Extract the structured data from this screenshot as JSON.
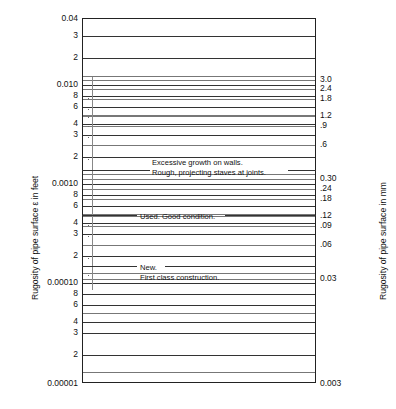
{
  "chart_data": {
    "type": "line",
    "title": "",
    "subtitle": "",
    "orientation": "vertical-log-scale",
    "grid": true,
    "legend_position": "none",
    "left_axis": {
      "label": "Rugosity of pipe surface ε in feet",
      "units": "feet",
      "scale": "log",
      "range": [
        1e-05,
        0.04
      ],
      "tick_labels": [
        "0.04",
        "3",
        "2",
        "0.010",
        "8",
        "6",
        "4",
        "3",
        "2",
        "0.0010",
        "8",
        "6",
        "4",
        "3",
        "2",
        "0.00010",
        "8",
        "6",
        "4",
        "3",
        "2",
        "0.00001"
      ],
      "tick_values": [
        0.04,
        0.03,
        0.02,
        0.01,
        0.008,
        0.006,
        0.004,
        0.003,
        0.002,
        0.001,
        0.0008,
        0.0006,
        0.0004,
        0.0003,
        0.0002,
        0.0001,
        8e-05,
        6e-05,
        4e-05,
        3e-05,
        2e-05,
        1e-05
      ]
    },
    "right_axis": {
      "label": "Rugosity of pipe surface in mm",
      "units": "mm",
      "scale": "log",
      "range": [
        0.003,
        12
      ],
      "tick_labels": [
        "3.0",
        "2.4",
        "1.8",
        "1.2",
        ".9",
        ".6",
        "0.30",
        ".24",
        ".18",
        ".12",
        ".09",
        ".06",
        "0.03",
        "0.003"
      ],
      "tick_values": [
        3.0,
        2.4,
        1.8,
        1.2,
        0.9,
        0.6,
        0.3,
        0.24,
        0.18,
        0.12,
        0.09,
        0.06,
        0.03,
        0.003
      ]
    },
    "annotations": [
      {
        "id": "excessive-growth",
        "line1": "Excessive growth on walls.",
        "line2": "Rough, projecting staves at joints."
      },
      {
        "id": "used-good",
        "line1": "Used. Good condition.",
        "line2": ""
      },
      {
        "id": "new-first-class",
        "line1": "New.",
        "line2": "First class construction."
      }
    ]
  },
  "left_ticks": [
    {
      "label": "0.04",
      "y": 18.0,
      "major": true
    },
    {
      "label": "3",
      "y": 35.0,
      "major": true
    },
    {
      "label": "2",
      "y": 57.0,
      "major": true
    },
    {
      "label": "",
      "y": 75.0,
      "major": false
    },
    {
      "label": "0.010",
      "y": 84.0,
      "major": true
    },
    {
      "label": "8",
      "y": 95.0,
      "major": true
    },
    {
      "label": "6",
      "y": 106.0,
      "major": true
    },
    {
      "label": "",
      "y": 114.0,
      "major": false
    },
    {
      "label": "4",
      "y": 123.0,
      "major": true
    },
    {
      "label": "3",
      "y": 134.0,
      "major": true
    },
    {
      "label": "2",
      "y": 156.0,
      "major": true
    },
    {
      "label": "",
      "y": 173.0,
      "major": false
    },
    {
      "label": "0.0010",
      "y": 183.0,
      "major": true
    },
    {
      "label": "8",
      "y": 194.0,
      "major": true
    },
    {
      "label": "6",
      "y": 205.0,
      "major": true
    },
    {
      "label": "",
      "y": 213.0,
      "major": false
    },
    {
      "label": "4",
      "y": 222.0,
      "major": true
    },
    {
      "label": "3",
      "y": 233.0,
      "major": true
    },
    {
      "label": "2",
      "y": 255.0,
      "major": true
    },
    {
      "label": "",
      "y": 272.0,
      "major": false
    },
    {
      "label": "0.00010",
      "y": 282.0,
      "major": true
    },
    {
      "label": "8",
      "y": 293.0,
      "major": true
    },
    {
      "label": "6",
      "y": 304.0,
      "major": true
    },
    {
      "label": "",
      "y": 312.0,
      "major": false
    },
    {
      "label": "4",
      "y": 321.0,
      "major": true
    },
    {
      "label": "3",
      "y": 332.0,
      "major": true
    },
    {
      "label": "2",
      "y": 354.0,
      "major": true
    },
    {
      "label": "",
      "y": 371.0,
      "major": false
    },
    {
      "label": "0.00001",
      "y": 383.0,
      "major": true
    }
  ],
  "right_ticks": [
    {
      "label": "3.0",
      "y": 79.0
    },
    {
      "label": "2.4",
      "y": 88.0
    },
    {
      "label": "1.8",
      "y": 98.0
    },
    {
      "label": "1.2",
      "y": 115.0
    },
    {
      "label": ".9",
      "y": 125.0
    },
    {
      "label": ".6",
      "y": 144.0
    },
    {
      "label": "0.30",
      "y": 178.0
    },
    {
      "label": ".24",
      "y": 188.0
    },
    {
      "label": ".18",
      "y": 198.0
    },
    {
      "label": ".12",
      "y": 215.0
    },
    {
      "label": ".09",
      "y": 225.0
    },
    {
      "label": ".06",
      "y": 244.0
    },
    {
      "label": "0.03",
      "y": 278.0
    },
    {
      "label": "0.003",
      "y": 383.0
    }
  ],
  "annotations": [
    {
      "line1": "Excessive growth on walls.",
      "line2": "Rough, projecting staves at joints.",
      "x": 152,
      "y": 158,
      "leader_y": 170,
      "leader_x1": 82,
      "leader_x2": 150,
      "leader2_x1": 288,
      "leader2_x2": 316
    },
    {
      "line1": "Used. Good condition.",
      "line2": "",
      "x": 140,
      "y": 212,
      "leader_y": 215,
      "leader_x1": 82,
      "leader_x2": 137,
      "leader2_x1": 225,
      "leader2_x2": 316
    },
    {
      "line1": "New.",
      "line2": "First class construction.",
      "x": 140,
      "y": 263,
      "leader_y": 266,
      "leader_x1": 82,
      "leader_x2": 137,
      "leader2_x1": 165,
      "leader2_x2": 316
    }
  ],
  "axis_titles": {
    "left": "Rugosity of pipe surface ε in feet",
    "right": "Rugosity of pipe surface in mm"
  }
}
